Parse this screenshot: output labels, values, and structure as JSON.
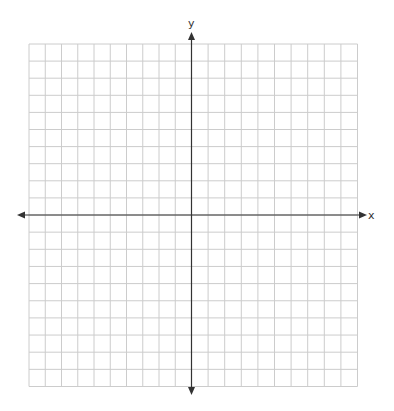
{
  "diagram": {
    "type": "coordinate-plane",
    "x_axis_label": "x",
    "y_axis_label": "y",
    "grid": {
      "columns": 20,
      "rows": 20,
      "columns_left_of_y_axis": 10,
      "columns_right_of_y_axis": 10,
      "rows_above_x_axis": 10,
      "rows_below_x_axis": 10
    },
    "colors": {
      "background": "#ffffff",
      "grid_line": "#cccccc",
      "axis_line": "#333333",
      "label": "#333333"
    }
  }
}
